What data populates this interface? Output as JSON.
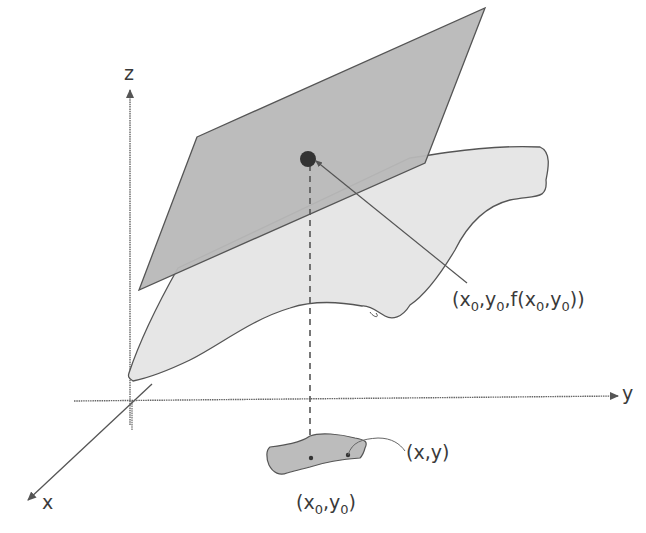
{
  "diagram": {
    "axes": {
      "x_label": "x",
      "y_label": "y",
      "z_label": "z"
    },
    "labels": {
      "tangent_point": {
        "open": "(x",
        "s1": "0",
        "mid1": ",y",
        "s2": "0",
        "mid2": ",f(x",
        "s3": "0",
        "mid3": ",y",
        "s4": "0",
        "close": "))"
      },
      "domain_point": "(x,y)",
      "base_point": {
        "open": "(x",
        "s1": "0",
        "mid": ",y",
        "s2": "0",
        "close": ")"
      }
    },
    "colors": {
      "tangent_plane_fill": "#b8b8b8",
      "surface_fill": "#e6e6e6",
      "domain_region_fill": "#bcbcbc",
      "stroke": "#555555",
      "axis": "#666666",
      "point": "#333333",
      "text": "#3a3a3a"
    }
  }
}
